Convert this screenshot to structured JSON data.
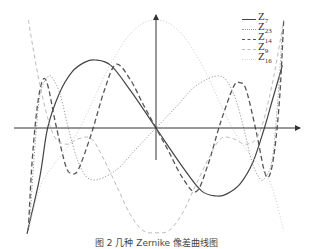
{
  "chart_data": {
    "type": "line",
    "title": "",
    "xlabel": "",
    "ylabel": "",
    "xlim": [
      -1,
      1
    ],
    "ylim": [
      -1,
      1
    ],
    "grid": false,
    "legend_position": "upper right",
    "axes": {
      "origin_px": [
        156,
        128
      ],
      "x_scale_px": 129,
      "y_scale_px": 108
    },
    "series": [
      {
        "name": "Z7",
        "sub": "7",
        "style": "solid",
        "color": "#444444",
        "width": 1.2,
        "x": [
          -1.0,
          -0.9,
          -0.84,
          -0.75,
          -0.65,
          -0.55,
          -0.47,
          -0.35,
          -0.2,
          0,
          0.2,
          0.35,
          0.47,
          0.55,
          0.65,
          0.75,
          0.84,
          0.9,
          0.98
        ],
        "y": [
          -0.98,
          -0.45,
          0,
          0.32,
          0.52,
          0.61,
          0.63,
          0.58,
          0.35,
          0,
          -0.35,
          -0.58,
          -0.63,
          -0.61,
          -0.52,
          -0.32,
          0,
          0.25,
          0.58
        ]
      },
      {
        "name": "Z23",
        "sub": "23",
        "style": "dotted",
        "color": "#999999",
        "width": 1.0,
        "x": [
          -0.98,
          -0.94,
          -0.9,
          -0.84,
          -0.8,
          -0.74,
          -0.68,
          -0.6,
          -0.5,
          -0.32,
          -0.16,
          0,
          0.16,
          0.32,
          0.5,
          0.6,
          0.68,
          0.74,
          0.8,
          0.84,
          0.9,
          0.94,
          0.98
        ],
        "y": [
          -0.9,
          -0.2,
          0.3,
          0.47,
          0.46,
          0.3,
          0,
          -0.32,
          -0.48,
          -0.4,
          -0.2,
          0,
          0.2,
          0.4,
          0.48,
          0.32,
          0,
          -0.3,
          -0.46,
          -0.47,
          -0.3,
          0.2,
          0.9
        ]
      },
      {
        "name": "Z14",
        "sub": "14",
        "style": "dashed",
        "color": "#555555",
        "width": 1.3,
        "x": [
          -0.99,
          -0.96,
          -0.92,
          -0.88,
          -0.84,
          -0.78,
          -0.7,
          -0.65,
          -0.6,
          -0.5,
          -0.4,
          -0.31,
          -0.2,
          -0.1,
          0,
          0.1,
          0.2,
          0.31,
          0.4,
          0.5,
          0.6,
          0.65,
          0.7,
          0.78,
          0.84,
          0.88,
          0.92,
          0.96,
          0.99
        ],
        "y": [
          -0.95,
          -0.3,
          0.2,
          0.44,
          0.4,
          0.05,
          -0.35,
          -0.42,
          -0.38,
          -0.05,
          0.35,
          0.59,
          0.45,
          0.22,
          0,
          -0.22,
          -0.45,
          -0.59,
          -0.35,
          0.05,
          0.38,
          0.42,
          0.35,
          -0.05,
          -0.4,
          -0.44,
          -0.2,
          0.3,
          1.0
        ]
      },
      {
        "name": "Z9",
        "sub": "9",
        "style": "dashed-light",
        "color": "#bbbbbb",
        "width": 1.0,
        "x": [
          -0.99,
          -0.9,
          -0.8,
          -0.7,
          -0.6,
          -0.5,
          -0.4,
          -0.3,
          -0.2,
          -0.1,
          0,
          0.1,
          0.2,
          0.3,
          0.4,
          0.5,
          0.6,
          0.7,
          0.8,
          0.9,
          0.99
        ],
        "y": [
          1.0,
          0.4,
          -0.05,
          -0.15,
          -0.1,
          -0.1,
          -0.3,
          -0.55,
          -0.8,
          -0.95,
          -0.97,
          -0.95,
          -0.8,
          -0.55,
          -0.3,
          -0.1,
          -0.1,
          -0.15,
          -0.05,
          0.4,
          1.0
        ]
      },
      {
        "name": "Z16",
        "sub": "16",
        "style": "dashdot-light",
        "color": "#cccccc",
        "width": 1.0,
        "x": [
          -0.99,
          -0.9,
          -0.8,
          -0.7,
          -0.6,
          -0.5,
          -0.4,
          -0.3,
          -0.2,
          -0.1,
          0,
          0.1,
          0.2,
          0.3,
          0.4,
          0.5,
          0.6,
          0.7,
          0.8,
          0.9,
          0.99
        ],
        "y": [
          -0.95,
          -0.55,
          -0.35,
          -0.2,
          -0.02,
          0.22,
          0.48,
          0.7,
          0.87,
          0.97,
          1.0,
          0.97,
          0.87,
          0.7,
          0.48,
          0.22,
          -0.02,
          -0.2,
          -0.35,
          -0.55,
          -0.95
        ]
      }
    ],
    "caption": "图 2  几种 Zernike 像差曲线图"
  }
}
